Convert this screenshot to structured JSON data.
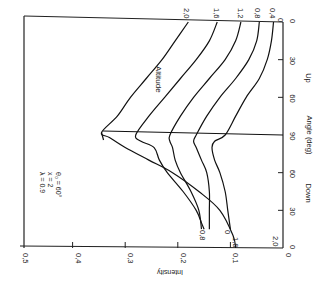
{
  "chart_data": {
    "type": "line",
    "orientation": "rotated-90-clockwise",
    "title": "",
    "xlabel": "Angle (deg)",
    "ylabel": "Intensity",
    "ylim": [
      0,
      0.5
    ],
    "y_ticks": [
      "0",
      "0.1",
      "0.2",
      "0.3",
      "0.4",
      "0.5"
    ],
    "x_ticks": {
      "up": [
        "0",
        "30",
        "60",
        "90"
      ],
      "down": [
        "60",
        "30",
        "0"
      ]
    },
    "x_sections": {
      "up_label": "Up",
      "down_label": "Down"
    },
    "legend_title": "Altitude",
    "parameters": [
      "λ = 0.9",
      "x = 2",
      "θ₀ = 60°"
    ],
    "horizon_angle": 90,
    "x_positions_note": "angle coordinate runs Up 0 → 90 then Down 90 → 0",
    "series": [
      {
        "name": "2.0",
        "points": [
          [
            "Up",
            0,
            0.18
          ],
          [
            "Up",
            15,
            0.205
          ],
          [
            "Up",
            30,
            0.23
          ],
          [
            "Up",
            45,
            0.26
          ],
          [
            "Up",
            60,
            0.29
          ],
          [
            "Up",
            75,
            0.315
          ],
          [
            "Up",
            88,
            0.345
          ],
          [
            "Down",
            88,
            0.33
          ],
          [
            "Down",
            80,
            0.3
          ],
          [
            "Down",
            70,
            0.255
          ],
          [
            "Down",
            60,
            0.21
          ],
          [
            "Down",
            45,
            0.16
          ],
          [
            "Down",
            30,
            0.12
          ],
          [
            "Down",
            10,
            0.095
          ],
          [
            "Down",
            0,
            0.09
          ]
        ]
      },
      {
        "name": "1.6",
        "points": [
          [
            "Up",
            0,
            0.125
          ],
          [
            "Up",
            15,
            0.14
          ],
          [
            "Up",
            30,
            0.165
          ],
          [
            "Up",
            45,
            0.195
          ],
          [
            "Up",
            60,
            0.225
          ],
          [
            "Up",
            75,
            0.255
          ],
          [
            "Up",
            90,
            0.28
          ],
          [
            "Down",
            85,
            0.27
          ],
          [
            "Down",
            80,
            0.245
          ],
          [
            "Down",
            70,
            0.235
          ],
          [
            "Down",
            60,
            0.22
          ],
          [
            "Down",
            45,
            0.19
          ],
          [
            "Down",
            30,
            0.165
          ],
          [
            "Down",
            20,
            0.155
          ],
          [
            "Down",
            15,
            0.15
          ]
        ]
      },
      {
        "name": "1.2",
        "points": [
          [
            "Up",
            0,
            0.08
          ],
          [
            "Up",
            15,
            0.09
          ],
          [
            "Up",
            30,
            0.11
          ],
          [
            "Up",
            45,
            0.14
          ],
          [
            "Up",
            60,
            0.17
          ],
          [
            "Up",
            75,
            0.195
          ],
          [
            "Up",
            90,
            0.215
          ],
          [
            "Down",
            85,
            0.215
          ],
          [
            "Down",
            80,
            0.21
          ],
          [
            "Down",
            70,
            0.205
          ],
          [
            "Down",
            60,
            0.195
          ],
          [
            "Down",
            45,
            0.175
          ],
          [
            "Down",
            30,
            0.16
          ],
          [
            "Down",
            15,
            0.155
          ]
        ]
      },
      {
        "name": "0.8",
        "points": [
          [
            "Up",
            0,
            0.045
          ],
          [
            "Up",
            15,
            0.05
          ],
          [
            "Up",
            30,
            0.065
          ],
          [
            "Up",
            45,
            0.09
          ],
          [
            "Up",
            60,
            0.12
          ],
          [
            "Up",
            75,
            0.145
          ],
          [
            "Up",
            90,
            0.165
          ],
          [
            "Down",
            85,
            0.17
          ],
          [
            "Down",
            80,
            0.165
          ],
          [
            "Down",
            70,
            0.155
          ],
          [
            "Down",
            60,
            0.145
          ],
          [
            "Down",
            45,
            0.14
          ],
          [
            "Down",
            30,
            0.14
          ],
          [
            "Down",
            15,
            0.14
          ]
        ]
      },
      {
        "name": "0.4",
        "points": [
          [
            "Up",
            0,
            0.018
          ],
          [
            "Up",
            15,
            0.022
          ],
          [
            "Up",
            30,
            0.03
          ],
          [
            "Up",
            45,
            0.045
          ],
          [
            "Up",
            60,
            0.07
          ],
          [
            "Up",
            75,
            0.09
          ],
          [
            "Up",
            90,
            0.11
          ],
          [
            "Down",
            85,
            0.13
          ],
          [
            "Down",
            80,
            0.135
          ],
          [
            "Down",
            70,
            0.13
          ],
          [
            "Down",
            60,
            0.12
          ],
          [
            "Down",
            45,
            0.11
          ],
          [
            "Down",
            30,
            0.105
          ],
          [
            "Down",
            15,
            0.1
          ]
        ]
      }
    ],
    "curve_labels_up": [
      "2.0",
      "1.6",
      "1.2",
      "0.8",
      "0.4",
      "0"
    ],
    "curve_labels_down": [
      "0.8",
      "0",
      "1.6",
      "2.0"
    ],
    "grid": false
  },
  "labels": {
    "altitude": "Altitude",
    "param1": "λ = 0.9",
    "param2": "x = 2",
    "param3": "θ₀ = 60°",
    "intensity": "Intensity",
    "angle": "Angle (deg)",
    "up": "Up",
    "down": "Down"
  }
}
